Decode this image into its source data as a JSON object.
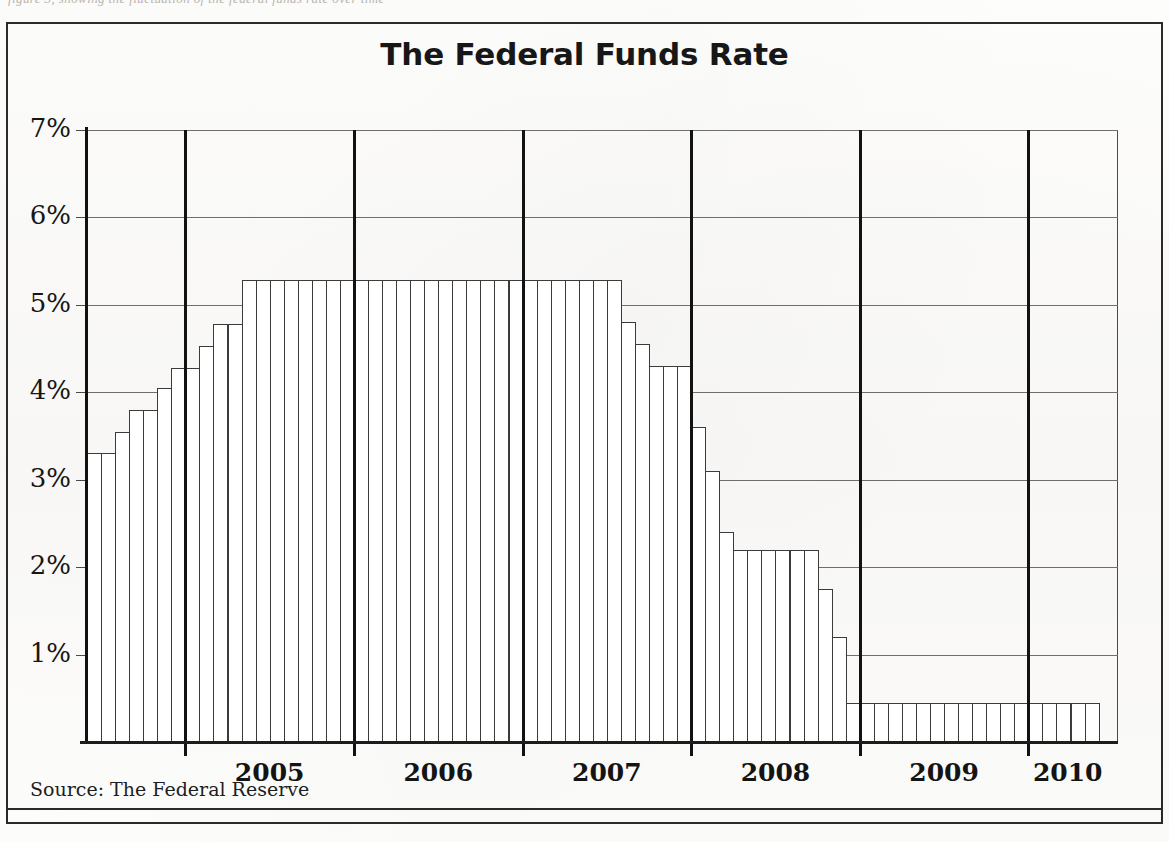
{
  "page": {
    "cropped_text_above": "figure 3, showing the fluctuation of the federal funds rate over time"
  },
  "figure": {
    "title": "The Federal Funds Rate",
    "source_label": "Source: The Federal Reserve"
  },
  "chart_data": {
    "type": "bar",
    "title": "The Federal Funds Rate",
    "xlabel": "",
    "ylabel": "",
    "ylim": [
      0,
      7
    ],
    "ytick_labels": [
      "1%",
      "2%",
      "3%",
      "4%",
      "5%",
      "6%",
      "7%"
    ],
    "ytick_values": [
      1,
      2,
      3,
      4,
      5,
      6,
      7
    ],
    "grid": true,
    "legend": "none",
    "year_labels": [
      "2005",
      "2006",
      "2007",
      "2008",
      "2009",
      "2010"
    ],
    "year_boundaries": [
      "2005",
      "2006",
      "2007",
      "2008",
      "2009",
      "2010"
    ],
    "note": "Monthly effective federal funds rate, mid-2004 through mid-2010",
    "categories": [
      "2004-06",
      "2004-07",
      "2004-08",
      "2004-09",
      "2004-10",
      "2004-11",
      "2004-12",
      "2005-01",
      "2005-02",
      "2005-03",
      "2005-04",
      "2005-05",
      "2005-06",
      "2005-07",
      "2005-08",
      "2005-09",
      "2005-10",
      "2005-11",
      "2005-12",
      "2006-01",
      "2006-02",
      "2006-03",
      "2006-04",
      "2006-05",
      "2006-06",
      "2006-07",
      "2006-08",
      "2006-09",
      "2006-10",
      "2006-11",
      "2006-12",
      "2007-01",
      "2007-02",
      "2007-03",
      "2007-04",
      "2007-05",
      "2007-06",
      "2007-07",
      "2007-08",
      "2007-09",
      "2007-10",
      "2007-11",
      "2007-12",
      "2008-01",
      "2008-02",
      "2008-03",
      "2008-04",
      "2008-05",
      "2008-06",
      "2008-07",
      "2008-08",
      "2008-09",
      "2008-10",
      "2008-11",
      "2008-12",
      "2009-01",
      "2009-02",
      "2009-03",
      "2009-04",
      "2009-05",
      "2009-06",
      "2009-07",
      "2009-08",
      "2009-09",
      "2009-10",
      "2009-11",
      "2009-12",
      "2010-01",
      "2010-02",
      "2010-03",
      "2010-04",
      "2010-05"
    ],
    "values": [
      3.3,
      3.3,
      3.55,
      3.8,
      3.8,
      4.05,
      4.28,
      4.28,
      4.53,
      4.78,
      4.78,
      5.28,
      5.28,
      5.28,
      5.28,
      5.28,
      5.28,
      5.28,
      5.28,
      5.28,
      5.28,
      5.28,
      5.28,
      5.28,
      5.28,
      5.28,
      5.28,
      5.28,
      5.28,
      5.28,
      5.28,
      5.28,
      5.28,
      5.28,
      5.28,
      5.28,
      5.28,
      5.28,
      4.8,
      4.55,
      4.3,
      4.3,
      4.3,
      3.6,
      3.1,
      2.4,
      2.2,
      2.2,
      2.2,
      2.2,
      2.2,
      2.2,
      1.75,
      1.2,
      0.45,
      0.45,
      0.45,
      0.45,
      0.45,
      0.45,
      0.45,
      0.45,
      0.45,
      0.45,
      0.45,
      0.45,
      0.45,
      0.45,
      0.45,
      0.45,
      0.45,
      0.45
    ]
  }
}
